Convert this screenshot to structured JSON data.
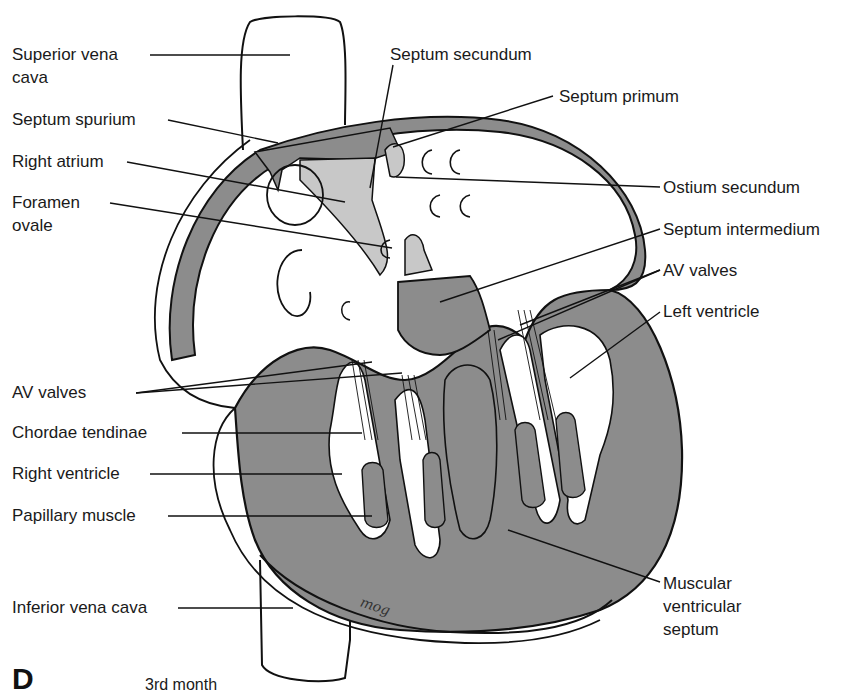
{
  "figure": {
    "panel_letter": "D",
    "caption": "3rd month",
    "signature": "mog",
    "colors": {
      "muscle_gray": "#8c8c8c",
      "septum_light": "#c8c8c8",
      "outline": "#111111",
      "background": "#ffffff"
    }
  },
  "labels_left": [
    {
      "id": "superior-vena-cava",
      "text": "Superior vena\ncava"
    },
    {
      "id": "septum-spurium",
      "text": "Septum spurium"
    },
    {
      "id": "right-atrium",
      "text": "Right atrium"
    },
    {
      "id": "foramen-ovale",
      "text": "Foramen\novale"
    },
    {
      "id": "av-valves-left",
      "text": "AV valves"
    },
    {
      "id": "chordae-tendinae",
      "text": "Chordae tendinae"
    },
    {
      "id": "right-ventricle",
      "text": "Right ventricle"
    },
    {
      "id": "papillary-muscle",
      "text": "Papillary muscle"
    },
    {
      "id": "inferior-vena-cava",
      "text": "Inferior vena cava"
    }
  ],
  "labels_right": [
    {
      "id": "septum-secundum",
      "text": "Septum secundum"
    },
    {
      "id": "septum-primum",
      "text": "Septum primum"
    },
    {
      "id": "ostium-secundum",
      "text": "Ostium secundum"
    },
    {
      "id": "septum-intermedium",
      "text": "Septum intermedium"
    },
    {
      "id": "av-valves-right",
      "text": "AV valves"
    },
    {
      "id": "left-ventricle",
      "text": "Left ventricle"
    },
    {
      "id": "muscular-ventricular-septum",
      "text": "Muscular\nventricular\nseptum"
    }
  ]
}
